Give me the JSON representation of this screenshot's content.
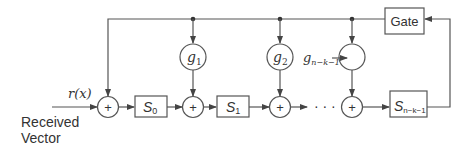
{
  "diagram": {
    "title": "",
    "input": {
      "signal_label": "r(x)",
      "source_label_line1": "Received",
      "source_label_line2": "Vector"
    },
    "gate": {
      "label": "Gate"
    },
    "registers": [
      {
        "id": "S0",
        "base": "S",
        "sub": "0"
      },
      {
        "id": "S1",
        "base": "S",
        "sub": "1"
      },
      {
        "id": "Snk1",
        "base": "S",
        "sub": "n−k−1"
      }
    ],
    "multipliers": [
      {
        "id": "g1",
        "base": "g",
        "sub": "1"
      },
      {
        "id": "g2",
        "base": "g",
        "sub": "2"
      },
      {
        "id": "gnk1",
        "base": "g",
        "sub": "n−k−1",
        "label_outside": true
      }
    ],
    "adders": [
      {
        "id": "add0",
        "symbol": "+"
      },
      {
        "id": "add1",
        "symbol": "+"
      },
      {
        "id": "add2",
        "symbol": "+"
      },
      {
        "id": "add3",
        "symbol": "+"
      }
    ],
    "ellipsis": "· · ·",
    "colors": {
      "stroke": "#555555",
      "text": "#333333",
      "background": "#ffffff"
    }
  }
}
